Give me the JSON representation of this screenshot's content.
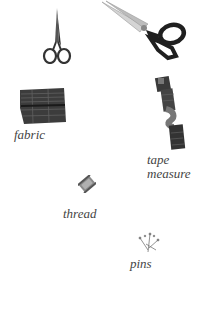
{
  "items": [
    {
      "id": "small-scissors",
      "label": ""
    },
    {
      "id": "large-scissors",
      "label": ""
    },
    {
      "id": "fabric",
      "label": "fabric"
    },
    {
      "id": "tape-measure",
      "label": "tape\nmeasure"
    },
    {
      "id": "thread",
      "label": "thread"
    },
    {
      "id": "pins",
      "label": "pins"
    }
  ],
  "colors": {
    "background": "#ffffff",
    "label_text": "#444444",
    "dark_object": "#2a2a2a",
    "fabric": "#3c3c3c",
    "blade": "#c8c8c8"
  }
}
